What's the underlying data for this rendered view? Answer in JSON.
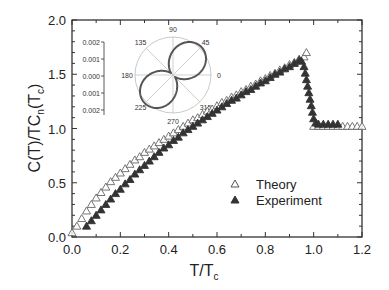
{
  "chart_data": {
    "type": "scatter",
    "title": "",
    "xlabel": "T/T_c",
    "ylabel": "C(T)/TC_n(T_c)",
    "xlim": [
      0.0,
      1.2
    ],
    "ylim": [
      0.0,
      2.0
    ],
    "xticks": [
      "0.0",
      "0.2",
      "0.4",
      "0.6",
      "0.8",
      "1.0",
      "1.2"
    ],
    "yticks": [
      "0.0",
      "0.5",
      "1.0",
      "1.5",
      "2.0"
    ],
    "grid": false,
    "legend_position": "lower right (inside)",
    "series": [
      {
        "name": "Theory",
        "marker": "open-triangle",
        "x": [
          0.0,
          0.02,
          0.04,
          0.06,
          0.08,
          0.1,
          0.12,
          0.14,
          0.16,
          0.18,
          0.2,
          0.22,
          0.24,
          0.26,
          0.28,
          0.3,
          0.32,
          0.34,
          0.36,
          0.38,
          0.4,
          0.42,
          0.44,
          0.46,
          0.48,
          0.5,
          0.52,
          0.54,
          0.56,
          0.58,
          0.6,
          0.62,
          0.64,
          0.66,
          0.68,
          0.7,
          0.72,
          0.74,
          0.76,
          0.78,
          0.8,
          0.82,
          0.84,
          0.86,
          0.88,
          0.9,
          0.92,
          0.94,
          0.96,
          0.97,
          1.0,
          1.02,
          1.04,
          1.06,
          1.08,
          1.1,
          1.12,
          1.14,
          1.16,
          1.18,
          1.2
        ],
        "y": [
          0.04,
          0.1,
          0.17,
          0.24,
          0.3,
          0.36,
          0.41,
          0.46,
          0.51,
          0.55,
          0.59,
          0.63,
          0.67,
          0.71,
          0.74,
          0.78,
          0.81,
          0.84,
          0.87,
          0.9,
          0.93,
          0.96,
          0.99,
          1.02,
          1.05,
          1.08,
          1.1,
          1.13,
          1.16,
          1.18,
          1.21,
          1.24,
          1.26,
          1.29,
          1.31,
          1.34,
          1.36,
          1.39,
          1.41,
          1.44,
          1.46,
          1.49,
          1.51,
          1.54,
          1.56,
          1.59,
          1.61,
          1.64,
          1.66,
          1.7,
          1.02,
          1.02,
          1.02,
          1.02,
          1.02,
          1.02,
          1.02,
          1.02,
          1.02,
          1.02,
          1.02
        ]
      },
      {
        "name": "Experiment",
        "marker": "filled-triangle",
        "x": [
          0.06,
          0.08,
          0.1,
          0.12,
          0.14,
          0.16,
          0.18,
          0.2,
          0.22,
          0.24,
          0.26,
          0.28,
          0.3,
          0.32,
          0.34,
          0.36,
          0.38,
          0.4,
          0.42,
          0.44,
          0.46,
          0.48,
          0.5,
          0.52,
          0.54,
          0.56,
          0.58,
          0.6,
          0.62,
          0.64,
          0.66,
          0.68,
          0.7,
          0.72,
          0.74,
          0.76,
          0.78,
          0.8,
          0.82,
          0.84,
          0.86,
          0.88,
          0.9,
          0.92,
          0.94,
          0.95,
          0.96,
          0.965,
          0.97,
          0.975,
          0.98,
          0.985,
          0.99,
          0.995,
          1.0,
          1.01,
          1.02,
          1.04,
          1.06,
          1.08,
          1.1
        ],
        "y": [
          0.1,
          0.15,
          0.2,
          0.25,
          0.3,
          0.35,
          0.4,
          0.44,
          0.49,
          0.53,
          0.58,
          0.62,
          0.66,
          0.7,
          0.74,
          0.78,
          0.82,
          0.85,
          0.89,
          0.92,
          0.96,
          0.99,
          1.02,
          1.05,
          1.08,
          1.11,
          1.14,
          1.17,
          1.2,
          1.23,
          1.26,
          1.28,
          1.31,
          1.34,
          1.36,
          1.39,
          1.42,
          1.44,
          1.47,
          1.5,
          1.52,
          1.55,
          1.57,
          1.6,
          1.63,
          1.62,
          1.57,
          1.51,
          1.45,
          1.39,
          1.33,
          1.27,
          1.21,
          1.15,
          1.09,
          1.05,
          1.04,
          1.04,
          1.04,
          1.04,
          1.04
        ]
      }
    ],
    "inset": {
      "type": "polar",
      "angle_labels": [
        "0",
        "45",
        "90",
        "135",
        "180",
        "225",
        "270",
        "315"
      ],
      "radial_tick_labels": [
        "0.002",
        "0.001",
        "0.000",
        "0.001",
        "0.002"
      ],
      "shape": "two-lobed figure-eight oriented along 45°–225°",
      "rmax": 0.002
    }
  },
  "legend": {
    "theory_label": "Theory",
    "experiment_label": "Experiment"
  },
  "axes": {
    "xlabel_main": "T/T",
    "xlabel_sub": "c",
    "ylabel_parts": [
      "C(T)/TC",
      "n",
      "(T",
      "c",
      ")"
    ]
  },
  "colors": {
    "axis": "#333333",
    "marker": "#444444",
    "inset_curve": "#555555",
    "inset_grid": "#bbbbbb"
  }
}
